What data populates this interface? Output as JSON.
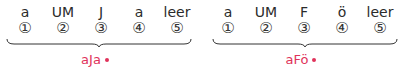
{
  "diagrams": [
    {
      "slots": [
        {
          "letter": "a",
          "num": "①"
        },
        {
          "letter": "UM",
          "num": "②"
        },
        {
          "letter": "J",
          "num": "③"
        },
        {
          "letter": "a",
          "num": "④"
        },
        {
          "letter": "leer",
          "num": "⑤"
        }
      ],
      "result": "aJa"
    },
    {
      "slots": [
        {
          "letter": "a",
          "num": "①"
        },
        {
          "letter": "UM",
          "num": "②"
        },
        {
          "letter": "F",
          "num": "③"
        },
        {
          "letter": "ö",
          "num": "④"
        },
        {
          "letter": "leer",
          "num": "⑤"
        }
      ],
      "result": "aFö"
    }
  ],
  "colors": {
    "accent": "#e0325a",
    "text": "#2b2b2b"
  }
}
